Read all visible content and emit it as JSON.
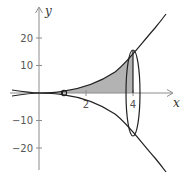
{
  "diagram": {
    "type": "solid-of-revolution",
    "curve": "y = x^3/4 and its reflection y = -x^3/4",
    "axes": {
      "x_label": "x",
      "y_label": "y",
      "x_ticks": [
        {
          "value": 2,
          "label": "2"
        },
        {
          "value": 4,
          "label": "4"
        }
      ],
      "y_ticks": [
        {
          "value": 20,
          "label": "20"
        },
        {
          "value": 10,
          "label": "10"
        },
        {
          "value": -10,
          "label": "−10"
        },
        {
          "value": -20,
          "label": "−20"
        }
      ]
    },
    "shaded_region": {
      "x_from": 1,
      "x_to": 4,
      "color": "#b3b3b3"
    },
    "colors": {
      "axis": "#8c8c8c",
      "curve": "#222222",
      "shading": "#b3b3b3",
      "text": "#555555"
    }
  }
}
